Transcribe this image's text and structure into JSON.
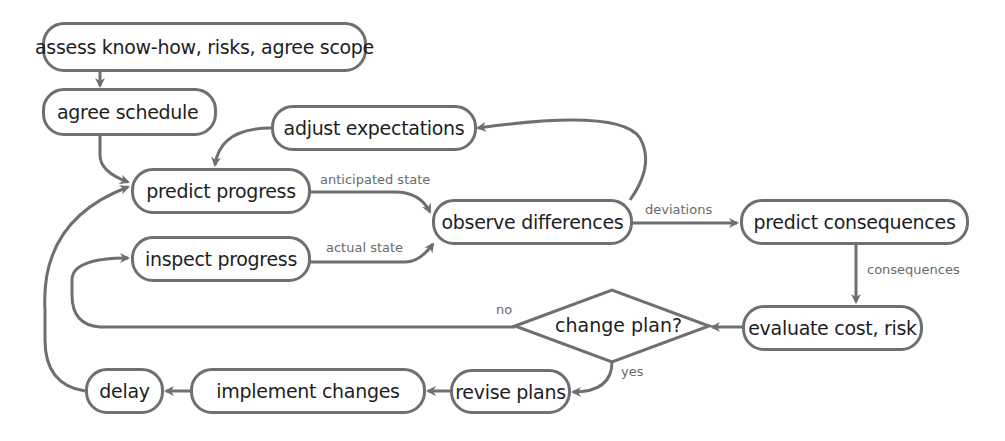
{
  "diagram": {
    "colors": {
      "stroke": "#6f6f6f",
      "text": "#1e1e1e",
      "edge_label": "#6a6a6a",
      "background": "#ffffff"
    },
    "nodes": {
      "assess": "assess know-how, risks, agree scope",
      "schedule": "agree schedule",
      "adjust": "adjust expectations",
      "predict_progress": "predict progress",
      "observe": "observe differences",
      "predict_consequences": "predict consequences",
      "inspect": "inspect progress",
      "decision": "change plan?",
      "evaluate": "evaluate cost, risk",
      "revise": "revise plans",
      "implement": "implement changes",
      "delay": "delay"
    },
    "edge_labels": {
      "anticipated": "anticipated state",
      "actual": "actual state",
      "deviations": "deviations",
      "consequences": "consequences",
      "no": "no",
      "yes": "yes"
    },
    "edges": [
      [
        "assess",
        "schedule"
      ],
      [
        "schedule",
        "predict_progress"
      ],
      [
        "adjust",
        "predict_progress"
      ],
      [
        "predict_progress",
        "observe",
        "anticipated state"
      ],
      [
        "inspect",
        "observe",
        "actual state"
      ],
      [
        "observe",
        "adjust"
      ],
      [
        "observe",
        "predict_consequences",
        "deviations"
      ],
      [
        "predict_consequences",
        "evaluate",
        "consequences"
      ],
      [
        "evaluate",
        "decision"
      ],
      [
        "decision",
        "inspect",
        "no"
      ],
      [
        "decision",
        "revise",
        "yes"
      ],
      [
        "revise",
        "implement"
      ],
      [
        "implement",
        "delay"
      ],
      [
        "delay",
        "predict_progress"
      ]
    ]
  }
}
